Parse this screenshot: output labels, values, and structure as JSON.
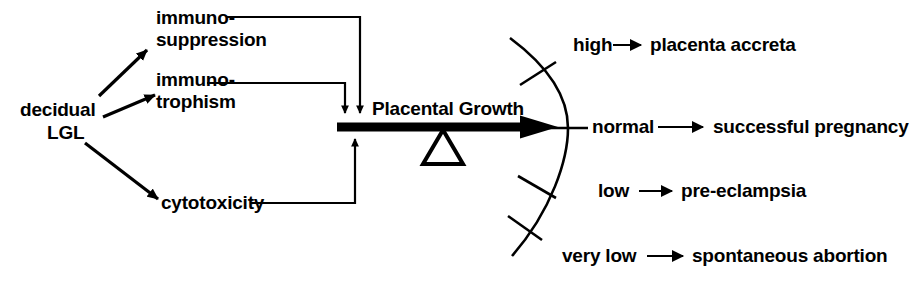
{
  "diagram": {
    "source_node": {
      "line1": "decidual",
      "line2": "LGL"
    },
    "functions": [
      {
        "id": "immunosuppression",
        "line1": "immuno-",
        "line2": "suppression",
        "effect": "inhibit"
      },
      {
        "id": "immunotrophism",
        "line1": "immuno-",
        "line2": "trophism",
        "effect": "inhibit"
      },
      {
        "id": "cytotoxicity",
        "line1": "cytotoxicity",
        "line2": "",
        "effect": "promote"
      }
    ],
    "lever": {
      "label": "Placental Growth",
      "fulcrum": "triangle-fulcrum"
    },
    "gauge": {
      "levels": [
        {
          "level": "high",
          "arrow": "→",
          "outcome": "placenta accreta"
        },
        {
          "level": "normal",
          "arrow": "→",
          "outcome": "successful pregnancy"
        },
        {
          "level": "low",
          "arrow": "→",
          "outcome": "pre-eclampsia"
        },
        {
          "level": "very low",
          "arrow": "→",
          "outcome": "spontaneous abortion"
        }
      ]
    },
    "colors": {
      "ink": "#000000",
      "background": "#ffffff"
    }
  }
}
